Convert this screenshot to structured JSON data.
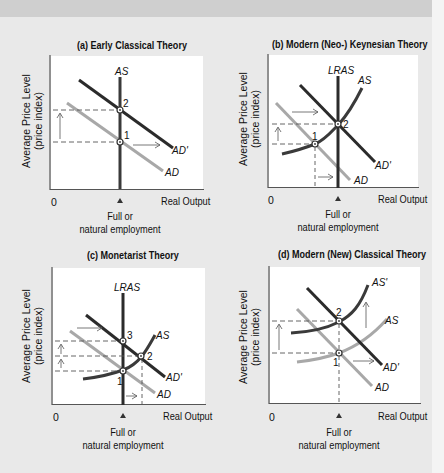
{
  "figure": {
    "colors": {
      "dark_curve": "#2b2b2b",
      "light_curve": "#a8a8a8",
      "background": "#e9e9e9",
      "plot_bg": "#ffffff"
    },
    "common": {
      "y_axis_label_line1": "Average Price Level",
      "y_axis_label_line2": "(price index)",
      "x_axis_label": "Real Output",
      "origin_label": "0",
      "marker_label_line1": "Full or",
      "marker_label_line2": "natural employment"
    },
    "panels": [
      {
        "id": "a",
        "title": "(a) Early Classical Theory",
        "curves": [
          "AS",
          "AD",
          "AD'"
        ],
        "points": [
          "1",
          "2"
        ]
      },
      {
        "id": "b",
        "title": "(b) Modern (Neo-) Keynesian Theory",
        "curves": [
          "LRAS",
          "AS",
          "AD",
          "AD'"
        ],
        "points": [
          "1",
          "2"
        ]
      },
      {
        "id": "c",
        "title": "(c) Monetarist Theory",
        "curves": [
          "LRAS",
          "AS",
          "AD",
          "AD'"
        ],
        "points": [
          "1",
          "2",
          "3"
        ]
      },
      {
        "id": "d",
        "title": "(d) Modern (New) Classical Theory",
        "curves": [
          "AS'",
          "AS",
          "AD",
          "AD'"
        ],
        "points": [
          "1",
          "2"
        ]
      }
    ]
  }
}
